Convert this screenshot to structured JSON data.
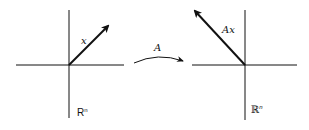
{
  "diagram": {
    "left": {
      "vector_label": "x",
      "space_label": "R",
      "space_sup": "n"
    },
    "map": {
      "label": "A"
    },
    "right": {
      "vector_label": "Ax",
      "space_label": "ℝ",
      "space_sup": "n"
    }
  }
}
